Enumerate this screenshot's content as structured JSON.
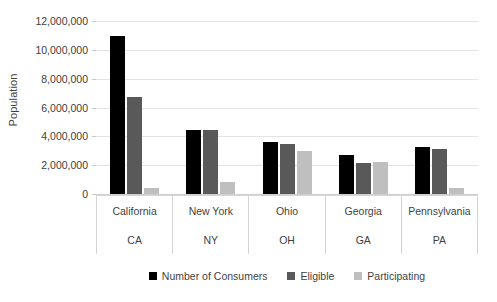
{
  "chart_data": {
    "type": "bar",
    "title": "",
    "xlabel": "",
    "ylabel": "Population",
    "ylim": [
      0,
      12000000
    ],
    "ytick_step": 2000000,
    "grid": true,
    "legend_position": "bottom",
    "categories": [
      "California",
      "New York",
      "Ohio",
      "Georgia",
      "Pennsylvania"
    ],
    "category_sublabels": [
      "CA",
      "NY",
      "OH",
      "GA",
      "PA"
    ],
    "ytick_labels": [
      "12,000,000",
      "10,000,000",
      "8,000,000",
      "6,000,000",
      "4,000,000",
      "2,000,000",
      "0"
    ],
    "ytick_values": [
      12000000,
      10000000,
      8000000,
      6000000,
      4000000,
      2000000,
      0
    ],
    "series": [
      {
        "name": "Number of Consumers",
        "color": "#000000",
        "values": [
          10950000,
          4450000,
          3600000,
          2700000,
          3250000
        ]
      },
      {
        "name": "Eligible",
        "color": "#595959",
        "values": [
          6700000,
          4450000,
          3450000,
          2150000,
          3100000
        ]
      },
      {
        "name": "Participating",
        "color": "#bfbfbf",
        "values": [
          450000,
          820000,
          2950000,
          2250000,
          400000
        ]
      }
    ]
  },
  "axis": {
    "y_title": "Population"
  }
}
